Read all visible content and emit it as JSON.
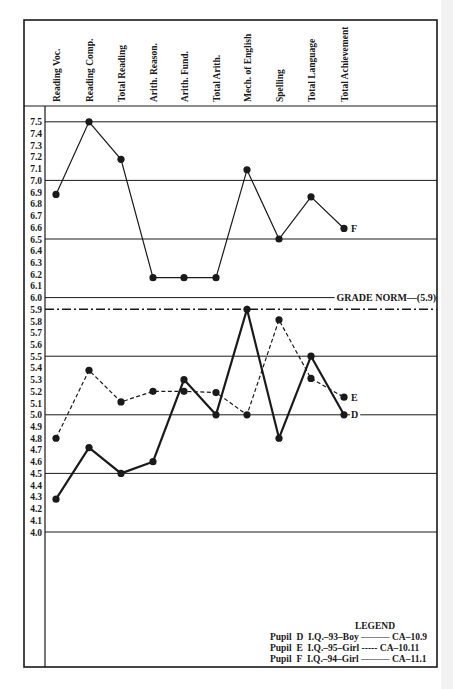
{
  "chart_data": {
    "type": "line",
    "title": "",
    "xlabel": "",
    "ylabel": "Grade level",
    "ylim": [
      4.0,
      7.5
    ],
    "y_ticks": [
      "7.5",
      "7.4",
      "7.3",
      "7.2",
      "7.1",
      "7.0",
      "6.9",
      "6.8",
      "6.7",
      "6.6",
      "6.5",
      "6.4",
      "6.3",
      "6.2",
      "6.1",
      "6.0",
      "5.9",
      "5.8",
      "5.7",
      "5.6",
      "5.5",
      "5.4",
      "5.3",
      "5.2",
      "5.1",
      "5.0",
      "4.9",
      "4.8",
      "4.7",
      "4.6",
      "4.5",
      "4.4",
      "4.3",
      "4.2",
      "4.1",
      "4.0"
    ],
    "gridlines": [
      7.5,
      7.0,
      6.5,
      6.0,
      5.5,
      5.0,
      4.5,
      4.0
    ],
    "categories": [
      "Reading Voc.",
      "Reading Comp.",
      "Total Reading",
      "Arith. Reason.",
      "Arith. Fund.",
      "Total Arith.",
      "Mech. of English",
      "Spelling",
      "Total Language",
      "Total Achievement"
    ],
    "series": [
      {
        "name": "Pupil D",
        "label": "D",
        "style": "solid-heavy",
        "values": [
          4.28,
          4.72,
          4.5,
          4.6,
          5.3,
          5.0,
          5.9,
          4.8,
          5.5,
          5.0
        ]
      },
      {
        "name": "Pupil E",
        "label": "E",
        "style": "dashed",
        "values": [
          4.8,
          5.38,
          5.11,
          5.2,
          5.2,
          5.19,
          5.0,
          5.81,
          5.31,
          5.15
        ]
      },
      {
        "name": "Pupil F",
        "label": "F",
        "style": "solid-thin",
        "values": [
          6.88,
          7.5,
          7.18,
          6.17,
          6.17,
          6.17,
          7.09,
          6.5,
          6.86,
          6.59
        ]
      }
    ],
    "annotations": [
      {
        "text": "GRADE NORM—(5.9)",
        "value": 5.9,
        "style": "dash-dot"
      }
    ],
    "legend": {
      "title": "LEGEND",
      "position": "bottom-right",
      "entries": [
        {
          "pupil": "Pupil",
          "id": "D",
          "info": "I.Q.–93–Boy",
          "line": "———",
          "ca": "CA–10.9"
        },
        {
          "pupil": "Pupil",
          "id": "E",
          "info": "I.Q.–95–Girl",
          "line": "-----",
          "ca": "CA–10.11"
        },
        {
          "pupil": "Pupil",
          "id": "F",
          "info": "I.Q.–94–Girl",
          "line": "———",
          "ca": "CA–11.1"
        }
      ]
    }
  },
  "colors": {
    "ink": "#1a1a1a",
    "paper": "#ffffff"
  }
}
